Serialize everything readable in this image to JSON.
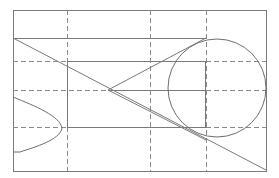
{
  "diagram": {
    "type": "geometric-construction",
    "colors": {
      "background": "#ffffff",
      "line": "#7a7a7a",
      "dashed": "#8a8a8a"
    },
    "frame": {
      "x1": 13,
      "y1": 10,
      "x2": 266,
      "y2": 171
    },
    "grid_verticals_x": [
      67,
      150,
      206
    ],
    "grid_horizontals_y": [
      61,
      90,
      127
    ],
    "circle": {
      "cx": 217,
      "cy": 88,
      "r": 49
    },
    "diagonal": {
      "from": [
        13,
        38
      ],
      "to": [
        266,
        170
      ]
    },
    "triangle": {
      "apex": [
        108,
        90
      ],
      "top": [
        206,
        38
      ],
      "bottom": [
        206,
        140
      ]
    },
    "left_curve": {
      "start": [
        13,
        97
      ],
      "tip": [
        62,
        128
      ],
      "end": [
        13,
        152
      ]
    }
  }
}
